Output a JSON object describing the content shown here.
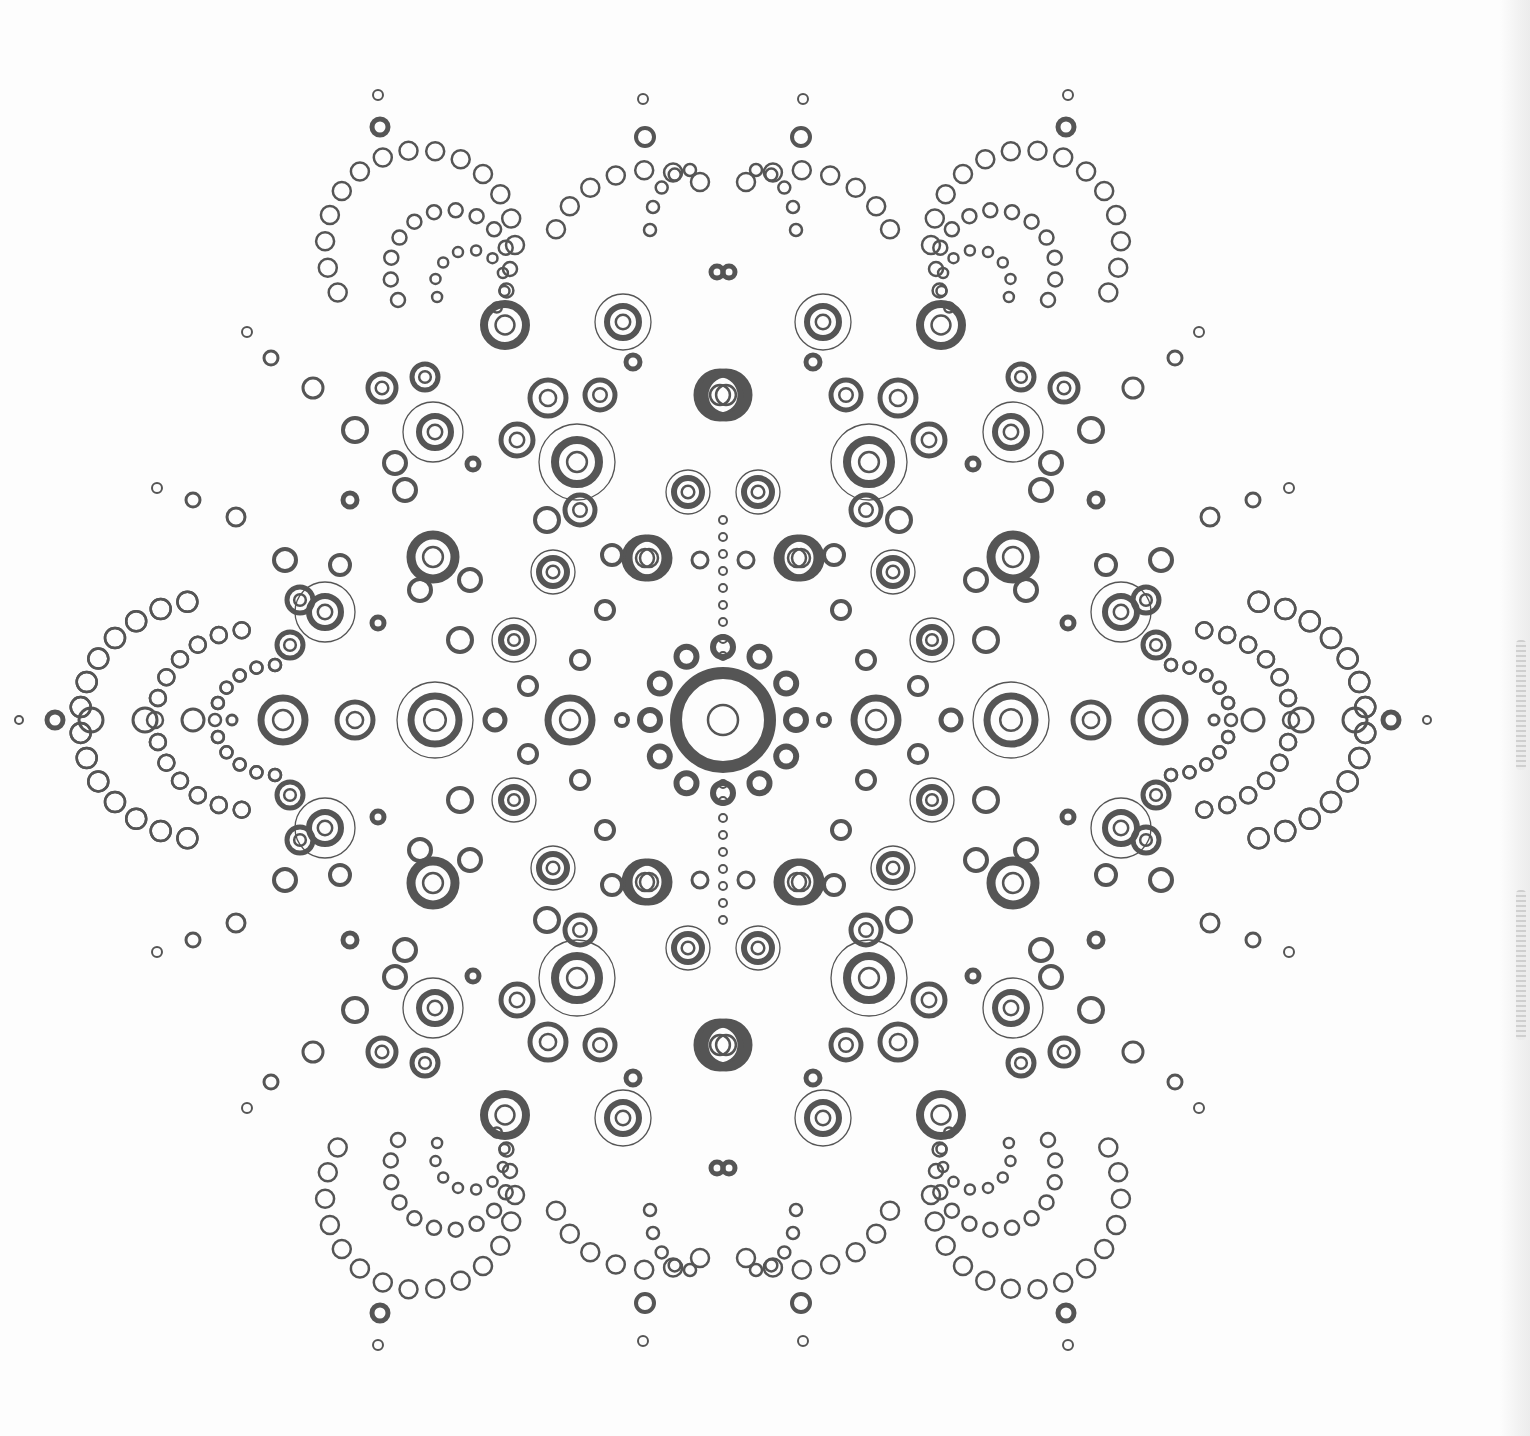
{
  "artwork": {
    "kind": "dot mandala coloring page",
    "center": [
      723,
      720
    ],
    "stroke_color": "#555555",
    "background": "#fdfdfd",
    "symmetry": "mirror-x-and-y",
    "motifs": {
      "center": {
        "outer_r": 47,
        "outer_w": 12,
        "inner_r": 15,
        "ring_count": 12,
        "ring_radius": 73,
        "ring_r": 10,
        "ring_w": 6
      },
      "quadrant_rings": [
        [
          570,
          720,
          22,
          7
        ],
        [
          435,
          720,
          24,
          7
        ],
        [
          283,
          720,
          22,
          7
        ],
        [
          355,
          720,
          18,
          5
        ],
        [
          495,
          720,
          10,
          5
        ],
        [
          622,
          720,
          6,
          4
        ],
        [
          645,
          558,
          20,
          7
        ],
        [
          797,
          558,
          20,
          7
        ],
        [
          433,
          557,
          22,
          9
        ],
        [
          577,
          462,
          22,
          8
        ],
        [
          720,
          395,
          22,
          9
        ],
        [
          505,
          325,
          21,
          8
        ],
        [
          553,
          572,
          14,
          6
        ],
        [
          514,
          640,
          13,
          6
        ],
        [
          325,
          612,
          16,
          6
        ],
        [
          435,
          432,
          16,
          6
        ],
        [
          688,
          492,
          14,
          6
        ],
        [
          623,
          322,
          16,
          6
        ],
        [
          380,
          127,
          8,
          5
        ],
        [
          645,
          137,
          9,
          4
        ],
        [
          643,
          99,
          5,
          2
        ],
        [
          378,
          95,
          5,
          2
        ],
        [
          350,
          500,
          7,
          5
        ],
        [
          157,
          488,
          5,
          2
        ],
        [
          193,
          500,
          7,
          3
        ],
        [
          236,
          517,
          9,
          3
        ],
        [
          247,
          332,
          5,
          2
        ],
        [
          271,
          358,
          7,
          3
        ],
        [
          313,
          388,
          10,
          3
        ],
        [
          729,
          272,
          6,
          5
        ],
        [
          473,
          464,
          6,
          5
        ],
        [
          633,
          362,
          7,
          5
        ],
        [
          378,
          623,
          6,
          5
        ],
        [
          232,
          720,
          5,
          3
        ],
        [
          55,
          720,
          8,
          5
        ],
        [
          19,
          720,
          4,
          2
        ],
        [
          91,
          720,
          12,
          3
        ],
        [
          145,
          720,
          12,
          3
        ],
        [
          193,
          720,
          11,
          3
        ],
        [
          548,
          398,
          18,
          5
        ],
        [
          517,
          440,
          16,
          5
        ],
        [
          600,
          395,
          15,
          5
        ],
        [
          580,
          510,
          15,
          5
        ],
        [
          547,
          520,
          12,
          4
        ],
        [
          355,
          430,
          12,
          4
        ],
        [
          382,
          388,
          14,
          5
        ],
        [
          425,
          377,
          13,
          5
        ],
        [
          395,
          463,
          11,
          4
        ],
        [
          300,
          600,
          13,
          5
        ],
        [
          290,
          645,
          13,
          5
        ],
        [
          285,
          560,
          11,
          4
        ],
        [
          340,
          565,
          10,
          4
        ],
        [
          612,
          555,
          10,
          4
        ],
        [
          605,
          610,
          9,
          4
        ],
        [
          580,
          660,
          9,
          4
        ],
        [
          528,
          686,
          9,
          4
        ],
        [
          700,
          560,
          8,
          3
        ],
        [
          460,
          640,
          12,
          4
        ],
        [
          470,
          580,
          11,
          4
        ],
        [
          420,
          590,
          11,
          4
        ],
        [
          405,
          490,
          11,
          4
        ]
      ],
      "halo_rings": [
        [
          577,
          462,
          38
        ],
        [
          433,
          432,
          30
        ],
        [
          325,
          612,
          30
        ],
        [
          514,
          640,
          22
        ],
        [
          553,
          572,
          22
        ],
        [
          688,
          492,
          22
        ],
        [
          623,
          322,
          28
        ],
        [
          435,
          720,
          38
        ]
      ]
    },
    "petal_arcs": [
      {
        "cx": 420,
        "cy": 245,
        "rx": 95,
        "ry": 95,
        "start": 150,
        "end": 360,
        "n": 14,
        "r": 9
      },
      {
        "cx": 450,
        "cy": 270,
        "rx": 60,
        "ry": 60,
        "start": 150,
        "end": 380,
        "n": 12,
        "r": 7
      },
      {
        "cx": 470,
        "cy": 285,
        "rx": 35,
        "ry": 35,
        "start": 160,
        "end": 400,
        "n": 9,
        "r": 5
      },
      {
        "cx": 210,
        "cy": 720,
        "rx": 130,
        "ry": 120,
        "start": 100,
        "end": 260,
        "n": 14,
        "r": 10
      },
      {
        "cx": 250,
        "cy": 720,
        "rx": 95,
        "ry": 90,
        "start": 95,
        "end": 265,
        "n": 13,
        "r": 8
      },
      {
        "cx": 275,
        "cy": 720,
        "rx": 60,
        "ry": 55,
        "start": 90,
        "end": 270,
        "n": 11,
        "r": 6
      },
      {
        "cx": 690,
        "cy": 230,
        "rx": 40,
        "ry": 60,
        "start": 180,
        "end": 270,
        "n": 5,
        "r": 6
      },
      {
        "cx": 650,
        "cy": 260,
        "rx": 100,
        "ry": 90,
        "start": 200,
        "end": 300,
        "n": 7,
        "r": 9
      }
    ]
  }
}
